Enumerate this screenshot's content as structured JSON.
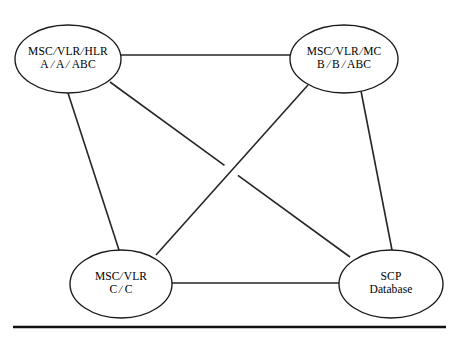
{
  "diagram": {
    "type": "node-link-diagram",
    "background_color": "#ffffff",
    "line_color": "#262626",
    "node_stroke_color": "#1a1a1a",
    "nodes": [
      {
        "id": "node-msc-vlr-hlr-a",
        "name": "msc-vlr-hlr-a",
        "shape": "ellipse",
        "cx": 68,
        "cy": 59,
        "rx": 53,
        "ry": 34,
        "label_top": "MSC/VLR/HLR",
        "label_bottom": "A / A /ABC",
        "segments_top": [
          "MSC",
          "VLR",
          "HLR"
        ],
        "segments_bottom": [
          "A",
          "A",
          "ABC"
        ],
        "separator": "/"
      },
      {
        "id": "node-msc-vlr-mc-b",
        "name": "msc-vlr-mc-b",
        "shape": "ellipse",
        "cx": 344,
        "cy": 59,
        "rx": 54,
        "ry": 34,
        "label_top": "MSC/VLR/MC",
        "label_bottom": "B / B /ABC",
        "segments_top": [
          "MSC",
          "VLR",
          "MC"
        ],
        "segments_bottom": [
          "B",
          "B",
          "ABC"
        ],
        "separator": "/"
      },
      {
        "id": "node-msc-vlr-c",
        "name": "msc-vlr-c",
        "shape": "ellipse",
        "cx": 121,
        "cy": 284,
        "rx": 51,
        "ry": 34,
        "label_top": "MSC/VLR",
        "label_bottom": "C / C",
        "segments_top": [
          "MSC",
          "VLR"
        ],
        "segments_bottom": [
          "C",
          "C"
        ],
        "separator": "/"
      },
      {
        "id": "node-scp-database",
        "name": "scp-database",
        "shape": "ellipse",
        "cx": 391,
        "cy": 284,
        "rx": 52,
        "ry": 34,
        "label_top": "SCP",
        "label_bottom": "Database",
        "segments_top": [
          "SCP"
        ],
        "segments_bottom": [
          "Database"
        ],
        "separator": ""
      }
    ],
    "edges": [
      {
        "id": "edge-a-to-b",
        "name": "edge-hlr-a-to-mc-b",
        "from": "node-msc-vlr-hlr-a",
        "to": "node-msc-vlr-mc-b",
        "x1": 121,
        "y1": 55,
        "x2": 290,
        "y2": 55,
        "broken": false
      },
      {
        "id": "edge-a-to-c",
        "name": "edge-hlr-a-to-msc-vlr-c",
        "from": "node-msc-vlr-hlr-a",
        "to": "node-msc-vlr-c",
        "x1": 68,
        "y1": 93,
        "x2": 119,
        "y2": 250,
        "broken": false
      },
      {
        "id": "edge-a-to-scp",
        "name": "edge-hlr-a-to-scp-database",
        "from": "node-msc-vlr-hlr-a",
        "to": "node-scp-database",
        "x1": 110,
        "y1": 82,
        "x2": 350,
        "y2": 257,
        "broken": true,
        "break_at_t": 0.505,
        "break_gap": 0.028
      },
      {
        "id": "edge-b-to-c",
        "name": "edge-mc-b-to-msc-vlr-c",
        "from": "node-msc-vlr-mc-b",
        "to": "node-msc-vlr-c",
        "x1": 308,
        "y1": 85,
        "x2": 156,
        "y2": 255,
        "broken": false
      },
      {
        "id": "edge-b-to-scp",
        "name": "edge-mc-b-to-scp-database",
        "from": "node-msc-vlr-mc-b",
        "to": "node-scp-database",
        "x1": 361,
        "y1": 91,
        "x2": 392,
        "y2": 250,
        "broken": false
      },
      {
        "id": "edge-c-to-scp",
        "name": "edge-msc-vlr-c-to-scp-database",
        "from": "node-msc-vlr-c",
        "to": "node-scp-database",
        "x1": 172,
        "y1": 283,
        "x2": 340,
        "y2": 283,
        "broken": false
      }
    ],
    "baseline_rule": {
      "name": "bottom-horizontal-rule",
      "x1": 13,
      "y1": 327,
      "x2": 446,
      "y2": 327
    }
  }
}
